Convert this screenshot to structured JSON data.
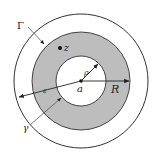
{
  "diagram": {
    "center": {
      "x": 81,
      "y": 81
    },
    "outer_circle": {
      "r": 67,
      "stroke": "#333333"
    },
    "annulus": {
      "r_outer": 49,
      "r_inner": 25,
      "fill": "#bdbdbd",
      "stroke": "#333333"
    },
    "labels": {
      "Gamma": "Γ",
      "z": "z",
      "rho": "ρ",
      "a": "a",
      "R": "R",
      "epsilon": "ε",
      "gamma": "γ"
    },
    "point_z": {
      "x": 60,
      "y": 48
    }
  }
}
